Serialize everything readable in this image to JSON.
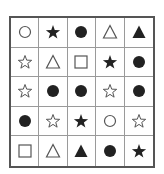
{
  "puzzle": {
    "rows": 5,
    "cols": 5,
    "colors": {
      "outer_border": "#555555",
      "inner_lines": "#9a9a9a",
      "shape_fill": "#222222",
      "shape_outline": "#555555"
    },
    "cells": [
      [
        "circle-outline",
        "star-filled",
        "circle-filled",
        "triangle-outline",
        "triangle-filled"
      ],
      [
        "star-outline",
        "triangle-outline",
        "square-outline",
        "star-filled",
        "circle-filled"
      ],
      [
        "star-outline",
        "circle-filled",
        "circle-filled",
        "star-outline",
        "circle-filled"
      ],
      [
        "circle-filled",
        "star-outline",
        "star-filled",
        "circle-outline",
        "star-outline"
      ],
      [
        "square-outline",
        "triangle-outline",
        "triangle-filled",
        "circle-filled",
        "star-filled"
      ]
    ]
  }
}
